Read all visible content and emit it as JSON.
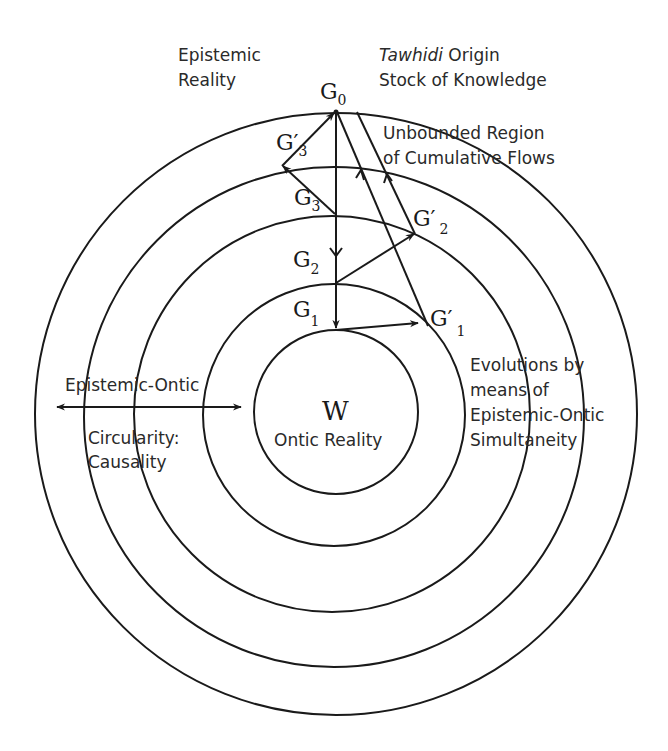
{
  "diagram": {
    "title_left": [
      "Epistemic",
      "Reality"
    ],
    "title_right": {
      "italic_word": "Tawhidi",
      "line1_rest": " Origin",
      "line2": "Stock of Knowledge"
    },
    "region_label": [
      "Unbounded Region",
      "of Cumulative Flows"
    ],
    "left_label_top": "Epistemic-Ontic",
    "left_label_bottom": [
      "Circularity:",
      "Causality"
    ],
    "right_label": [
      "Evolutions by",
      "means of",
      "Epistemic-Ontic",
      "Simultaneity"
    ],
    "center": {
      "symbol": "W",
      "label": "Ontic Reality"
    },
    "nodes": {
      "G0": {
        "base": "G",
        "sub": "0"
      },
      "G1": {
        "base": "G",
        "sub": "1"
      },
      "G2": {
        "base": "G",
        "sub": "2"
      },
      "G3": {
        "base": "G",
        "sub": "3"
      },
      "G1p": {
        "base": "G′",
        "sub": "1"
      },
      "G2p": {
        "base": "G′",
        "sub": "2"
      },
      "G3p": {
        "base": "G′",
        "sub": "3"
      }
    },
    "rings": [
      {
        "name": "ring-1-ontic",
        "cx": 336,
        "cy": 412,
        "r": 82
      },
      {
        "name": "ring-2",
        "cx": 334,
        "cy": 415,
        "r": 131
      },
      {
        "name": "ring-3",
        "cx": 332,
        "cy": 414,
        "r": 198
      },
      {
        "name": "ring-4",
        "cx": 334,
        "cy": 417,
        "r": 250
      },
      {
        "name": "ring-5-outer",
        "cx": 336,
        "cy": 414,
        "r": 301
      }
    ],
    "stroke_color": "#1a1a1a"
  }
}
